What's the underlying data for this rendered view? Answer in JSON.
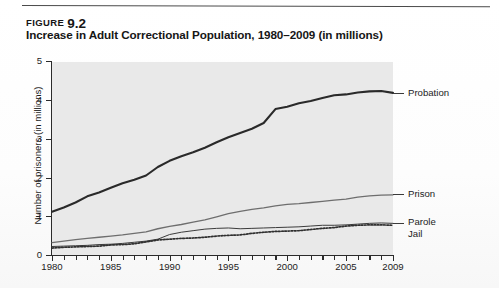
{
  "figure": {
    "label": "FIGURE",
    "number": "9.2",
    "title": "Increase in Adult Correctional Population, 1980–2009 (in millions)"
  },
  "chart_data": {
    "type": "line",
    "title": "Increase in Adult Correctional Population, 1980–2009 (in millions)",
    "xlabel": "",
    "ylabel": "Number of prisoners (in millions)",
    "xlim": [
      1980,
      2009
    ],
    "ylim": [
      0,
      5
    ],
    "ytick_labels": [
      "0",
      "1",
      "2",
      "3",
      "4",
      "5"
    ],
    "ytick_values": [
      0,
      1,
      2,
      3,
      4,
      5
    ],
    "xtick_labels": [
      "1980",
      "1985",
      "1990",
      "1995",
      "2000",
      "2005",
      "2009"
    ],
    "xtick_values": [
      1980,
      1985,
      1990,
      1995,
      2000,
      2005,
      2009
    ],
    "minor_xticks": "every year 1980-2009",
    "grid": false,
    "legend_position": "right-of-plot, inline labels with leader lines",
    "plot_background": "#e9e9e9",
    "x": [
      1980,
      1981,
      1982,
      1983,
      1984,
      1985,
      1986,
      1987,
      1988,
      1989,
      1990,
      1991,
      1992,
      1993,
      1994,
      1995,
      1996,
      1997,
      1998,
      1999,
      2000,
      2001,
      2002,
      2003,
      2004,
      2005,
      2006,
      2007,
      2008,
      2009
    ],
    "series": [
      {
        "name": "Probation",
        "color": "#2a2a2a",
        "style": "solid-thick",
        "values": [
          1.12,
          1.23,
          1.36,
          1.52,
          1.62,
          1.74,
          1.86,
          1.95,
          2.06,
          2.28,
          2.44,
          2.56,
          2.66,
          2.78,
          2.92,
          3.05,
          3.16,
          3.27,
          3.42,
          3.78,
          3.84,
          3.93,
          3.99,
          4.07,
          4.14,
          4.16,
          4.21,
          4.24,
          4.25,
          4.2
        ]
      },
      {
        "name": "Prison",
        "color": "#6e6e6e",
        "style": "solid-medium",
        "values": [
          0.32,
          0.36,
          0.4,
          0.43,
          0.46,
          0.49,
          0.52,
          0.56,
          0.6,
          0.68,
          0.74,
          0.79,
          0.85,
          0.91,
          0.99,
          1.07,
          1.13,
          1.18,
          1.22,
          1.27,
          1.31,
          1.33,
          1.36,
          1.39,
          1.42,
          1.45,
          1.5,
          1.53,
          1.55,
          1.56
        ]
      },
      {
        "name": "Parole",
        "color": "#3c3c3c",
        "style": "solid-thin",
        "values": [
          0.22,
          0.23,
          0.24,
          0.25,
          0.27,
          0.28,
          0.3,
          0.33,
          0.36,
          0.41,
          0.53,
          0.59,
          0.63,
          0.67,
          0.69,
          0.7,
          0.68,
          0.69,
          0.7,
          0.71,
          0.72,
          0.73,
          0.75,
          0.77,
          0.77,
          0.78,
          0.8,
          0.82,
          0.83,
          0.82
        ]
      },
      {
        "name": "Jail",
        "color": "#2f2f2f",
        "style": "dotted",
        "values": [
          0.18,
          0.2,
          0.21,
          0.22,
          0.23,
          0.26,
          0.27,
          0.29,
          0.34,
          0.39,
          0.41,
          0.43,
          0.44,
          0.46,
          0.49,
          0.51,
          0.52,
          0.56,
          0.59,
          0.61,
          0.62,
          0.63,
          0.66,
          0.69,
          0.71,
          0.75,
          0.77,
          0.78,
          0.78,
          0.77
        ]
      }
    ]
  },
  "series_labels": [
    {
      "name": "Probation"
    },
    {
      "name": "Prison"
    },
    {
      "name": "Parole"
    },
    {
      "name": "Jail"
    }
  ]
}
